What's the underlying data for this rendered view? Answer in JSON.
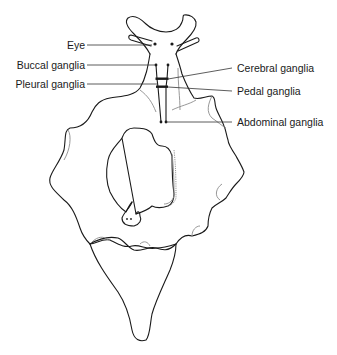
{
  "diagram": {
    "labels_left": [
      {
        "id": "eye",
        "text": "Eye"
      },
      {
        "id": "buccal",
        "text": "Buccal ganglia"
      },
      {
        "id": "pleural",
        "text": "Pleural ganglia"
      }
    ],
    "labels_right": [
      {
        "id": "cerebral",
        "text": "Cerebral ganglia"
      },
      {
        "id": "pedal",
        "text": "Pedal ganglia"
      },
      {
        "id": "abdominal",
        "text": "Abdominal ganglia"
      }
    ],
    "colors": {
      "outline": "#1a1a1a",
      "secondary_outline": "#8c8c8c",
      "leader_line": "#333333",
      "background": "#ffffff"
    }
  }
}
